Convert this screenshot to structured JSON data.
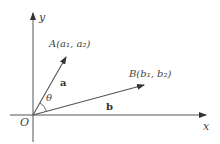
{
  "diagram": {
    "type": "vector-angle",
    "axes": {
      "x_label": "x",
      "y_label": "y",
      "origin_label": "O"
    },
    "vectors": [
      {
        "name": "a",
        "label": "a",
        "tip_label": "A(a₁, a₂)",
        "point": "A",
        "coords": [
          "a₁",
          "a₂"
        ]
      },
      {
        "name": "b",
        "label": "b",
        "tip_label": "B(b₁, b₂)",
        "point": "B",
        "coords": [
          "b₁",
          "b₂"
        ]
      }
    ],
    "angle_label": "θ",
    "colors": {
      "line": "#555555",
      "text": "#444444",
      "background": "#ffffff"
    }
  }
}
